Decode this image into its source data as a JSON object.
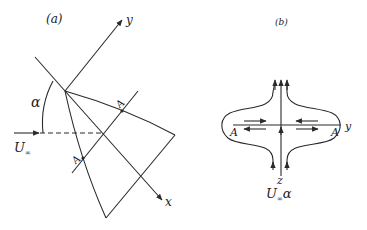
{
  "panel_a": {
    "label": "(a)",
    "axis_y_label": "y",
    "axis_x_label": "x",
    "angle_label": "α",
    "freestream_label": "U",
    "freestream_sub": "∞",
    "point_top_label": "A",
    "point_bottom_label": "A"
  },
  "panel_b": {
    "label": "(b)",
    "axis_y_label": "y",
    "axis_z_label": "z",
    "left_point_label": "A",
    "right_point_label": "A",
    "inflow_label_main": "U",
    "inflow_label_sub": "∞",
    "inflow_label_alpha": "α"
  }
}
